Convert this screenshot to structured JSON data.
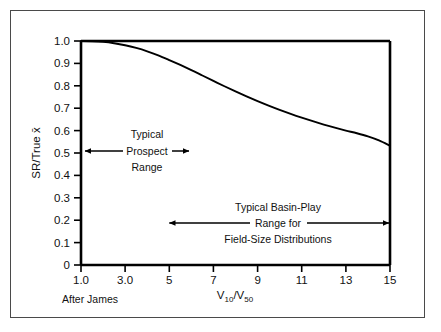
{
  "figure": {
    "credit": "After James",
    "frame_color": "#4a4a4a",
    "axis_color": "#000000",
    "curve_color": "#000000",
    "background": "#ffffff"
  },
  "chart_data": {
    "type": "line",
    "title": "",
    "xlabel_parts": {
      "base1": "V",
      "sub1": "10",
      "slash": "/",
      "base2": "V",
      "sub2": "50"
    },
    "xlabel": "V10/V50",
    "ylabel_parts": {
      "prefix": "SR/True ",
      "symbol": "x̄"
    },
    "ylabel": "SR/True x̄",
    "xlim": [
      1.0,
      15.0
    ],
    "ylim": [
      0.0,
      1.0
    ],
    "grid": false,
    "legend": "none",
    "x_ticks": [
      1.0,
      3.0,
      5,
      7,
      9,
      11,
      13,
      15
    ],
    "x_tick_labels": [
      "1.0",
      "3.0",
      "5",
      "7",
      "9",
      "11",
      "13",
      "15"
    ],
    "y_ticks": [
      0,
      0.1,
      0.2,
      0.3,
      0.4,
      0.5,
      0.6,
      0.7,
      0.8,
      0.9,
      1.0
    ],
    "y_tick_labels": [
      "0",
      "0.1",
      "0.2",
      "0.3",
      "0.4",
      "0.5",
      "0.6",
      "0.7",
      "0.8",
      "0.9",
      "1.0"
    ],
    "series": [
      {
        "name": "SR/True mean vs V10/V50",
        "x": [
          1.0,
          1.5,
          2.0,
          2.5,
          3.0,
          3.5,
          4.0,
          4.5,
          5.0,
          5.5,
          6.0,
          6.5,
          7.0,
          7.5,
          8.0,
          8.5,
          9.0,
          9.5,
          10.0,
          10.5,
          11.0,
          11.5,
          12.0,
          12.5,
          13.0,
          13.5,
          14.0,
          14.5,
          15.0
        ],
        "values": [
          1.0,
          0.999,
          0.996,
          0.99,
          0.981,
          0.969,
          0.954,
          0.936,
          0.915,
          0.893,
          0.87,
          0.846,
          0.822,
          0.798,
          0.775,
          0.753,
          0.732,
          0.712,
          0.693,
          0.675,
          0.658,
          0.642,
          0.627,
          0.613,
          0.6,
          0.588,
          0.574,
          0.556,
          0.532
        ]
      }
    ],
    "annotations": [
      {
        "id": "prospect-range",
        "lines": [
          "Typical",
          "Prospect",
          "Range"
        ],
        "arrow_x_start": 1.0,
        "arrow_x_end": 5.5,
        "arrow_y": 0.51,
        "style": "double-headed"
      },
      {
        "id": "basin-play-range",
        "lines": [
          "Typical Basin-Play",
          "Range for",
          "Field-Size Distributions"
        ],
        "arrow_x_start": 5.0,
        "arrow_x_end": 15.0,
        "arrow_y": 0.195,
        "style": "double-headed"
      }
    ]
  }
}
